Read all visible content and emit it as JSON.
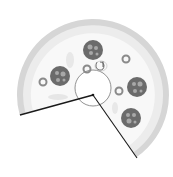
{
  "image": {
    "subject": "pizza with one slice removed",
    "alt": "Grayscale pizza icon with a missing slice"
  },
  "colors": {
    "background": "#ffffff",
    "crust": "#d4d4d4",
    "crust_inner": "#e6e6e6",
    "cheese": "#f7f7f7",
    "pepperoni": "#6b6b6b",
    "pepperoni_spot": "#a8a8a8",
    "olive_ring": "#8a8a8a",
    "cut_line": "#1a1a1a",
    "center_circle": "#777777"
  }
}
